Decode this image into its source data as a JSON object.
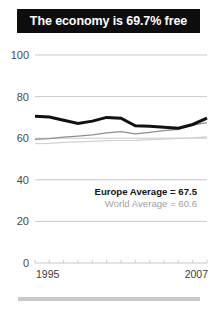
{
  "title": {
    "text": "The economy is 69.7% free"
  },
  "legend": {
    "europe": "Europe Average = 67.5",
    "world": "World Average = 60.6"
  },
  "colors": {
    "title_bar_bg": "#0d0d0d",
    "title_text": "#ffffff",
    "country_line": "#111111",
    "europe_line": "#8f8f8f",
    "world_line": "#d2d2d2",
    "gridline": "#c4c4c4",
    "axis_label": "#4a4a4a",
    "bottom_rule": "#c9c9c9"
  },
  "chart_data": {
    "type": "line",
    "title": "The economy is 69.7% free",
    "xlabel": "",
    "ylabel": "",
    "ylim": [
      0,
      100
    ],
    "yticks": [
      0,
      20,
      40,
      60,
      80,
      100
    ],
    "ytick_labels": [
      "0",
      "20",
      "40",
      "60",
      "80",
      "100"
    ],
    "xlim": [
      1995,
      2007
    ],
    "xticks": [
      1995,
      1996,
      1997,
      1998,
      1999,
      2000,
      2001,
      2002,
      2003,
      2004,
      2005,
      2006,
      2007
    ],
    "xtick_labels_shown": [
      "1995",
      "2007"
    ],
    "grid": true,
    "legend_position": "inside-right",
    "x": [
      1995,
      1996,
      1997,
      1998,
      1999,
      2000,
      2001,
      2002,
      2003,
      2004,
      2005,
      2006,
      2007
    ],
    "series": [
      {
        "name": "Country",
        "style": "thick-black",
        "color": "#111111",
        "values": [
          70.5,
          70.2,
          68.6,
          67.1,
          68.2,
          70.0,
          69.6,
          66.0,
          65.8,
          65.3,
          64.8,
          66.6,
          69.7
        ]
      },
      {
        "name": "Europe Average",
        "style": "medium-gray",
        "color": "#8f8f8f",
        "average": 67.5,
        "values": [
          59.4,
          59.8,
          60.5,
          61.0,
          61.6,
          62.6,
          63.2,
          62.1,
          62.8,
          63.6,
          64.3,
          66.3,
          67.5
        ]
      },
      {
        "name": "World Average",
        "style": "light-gray",
        "color": "#d2d2d2",
        "average": 60.6,
        "values": [
          57.4,
          57.5,
          58.0,
          58.2,
          58.5,
          58.8,
          58.9,
          59.0,
          59.3,
          59.6,
          59.9,
          60.2,
          60.6
        ]
      }
    ]
  }
}
